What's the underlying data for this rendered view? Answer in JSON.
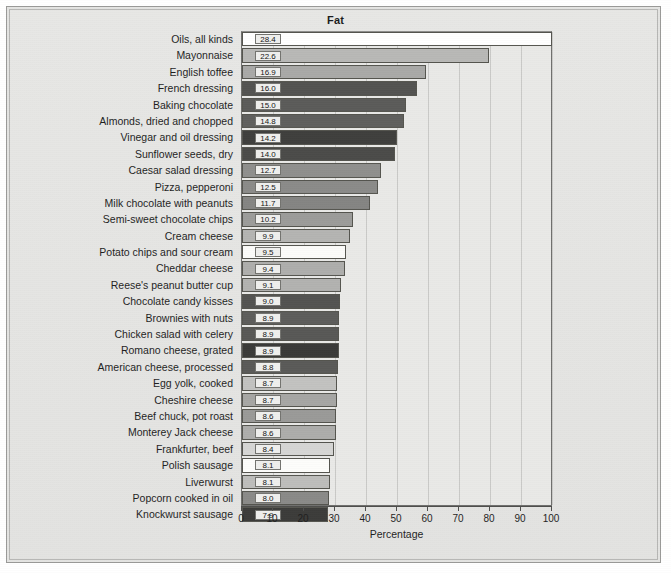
{
  "chart_data": {
    "type": "bar",
    "orientation": "horizontal",
    "title": "Fat",
    "xlabel": "Percentage",
    "ylabel": "",
    "xlim": [
      0,
      100
    ],
    "xticks": [
      0,
      10,
      20,
      30,
      40,
      50,
      60,
      70,
      80,
      90,
      100
    ],
    "grid": true,
    "legend": null,
    "value_label_suffix": "",
    "categories": [
      "Oils, all kinds",
      "Mayonnaise",
      "English toffee",
      "French dressing",
      "Baking chocolate",
      "Almonds, dried and chopped",
      "Vinegar and oil dressing",
      "Sunflower seeds, dry",
      "Caesar salad dressing",
      "Pizza, pepperoni",
      "Milk chocolate with peanuts",
      "Semi-sweet chocolate chips",
      "Cream cheese",
      "Potato chips and sour cream",
      "Cheddar cheese",
      "Reese's peanut butter cup",
      "Chocolate candy kisses",
      "Brownies with nuts",
      "Chicken salad with celery",
      "Romano cheese, grated",
      "American cheese, processed",
      "Egg yolk, cooked",
      "Cheshire cheese",
      "Beef chuck, pot roast",
      "Monterey Jack cheese",
      "Frankfurter, beef",
      "Polish sausage",
      "Liverwurst",
      "Popcorn cooked in oil",
      "Knockwurst sausage"
    ],
    "values": [
      28.4,
      22.6,
      16.9,
      16.0,
      15.0,
      14.8,
      14.2,
      14.0,
      12.7,
      12.5,
      11.7,
      10.2,
      9.9,
      9.5,
      9.4,
      9.1,
      9.0,
      8.9,
      8.9,
      8.9,
      8.8,
      8.7,
      8.7,
      8.6,
      8.6,
      8.4,
      8.1,
      8.1,
      8.0,
      7.9
    ],
    "value_labels": [
      "28.4",
      "22.6",
      "16.9",
      "16.0",
      "15.0",
      "14.8",
      "14.2",
      "14.0",
      "12.7",
      "12.5",
      "11.7",
      "10.2",
      "9.9",
      "9.5",
      "9.4",
      "9.1",
      "9.0",
      "8.9",
      "8.9",
      "8.9",
      "8.8",
      "8.7",
      "8.7",
      "8.6",
      "8.6",
      "8.4",
      "8.1",
      "8.1",
      "8.0",
      "7.9"
    ],
    "bar_lengths_percent": [
      100.0,
      79.6,
      59.5,
      56.3,
      52.8,
      52.1,
      50.0,
      49.3,
      44.7,
      44.0,
      41.2,
      35.9,
      34.9,
      33.5,
      33.1,
      32.0,
      31.7,
      31.3,
      31.3,
      31.3,
      31.0,
      30.6,
      30.6,
      30.3,
      30.3,
      29.6,
      28.5,
      28.5,
      28.2,
      27.8
    ],
    "bar_colors": [
      "#ffffff",
      "#b8b8b6",
      "#a9a9a7",
      "#535351",
      "#5b5b59",
      "#5f5f5d",
      "#3f3f3d",
      "#4b4b49",
      "#8f8f8d",
      "#8b8b89",
      "#858583",
      "#9c9c9a",
      "#b4b4b2",
      "#fbfbf9",
      "#aeaeac",
      "#b2b2b0",
      "#535351",
      "#5d5d5b",
      "#58585 6",
      "#3a3a38",
      "#5a5a58",
      "#c2c2c0",
      "#a6a6a4",
      "#9a9a98",
      "#adadab",
      "#d6d6d4",
      "#fdfdfb",
      "#bdbdbb",
      "#8a8a88",
      "#3c3c3a"
    ]
  },
  "axis": {
    "x_tick_labels": [
      "0",
      "10",
      "20",
      "30",
      "40",
      "50",
      "60",
      "70",
      "80",
      "90",
      "100"
    ]
  }
}
